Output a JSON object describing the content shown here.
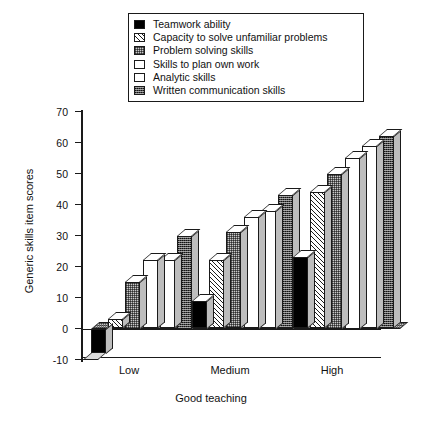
{
  "chart_data": {
    "type": "bar",
    "title": "",
    "subtitle": "",
    "xlabel": "Good teaching",
    "ylabel": "Generic skills item scores",
    "categories": [
      "Low",
      "Medium",
      "High"
    ],
    "ylim": [
      -10,
      70
    ],
    "yticks": [
      -10,
      0,
      10,
      20,
      30,
      40,
      50,
      60,
      70
    ],
    "grid": false,
    "legend_position": "top-center",
    "style": "3d-clustered-column",
    "series": [
      {
        "name": "Teamwork ability",
        "pattern": "solid-black",
        "values": [
          -8,
          9,
          23
        ]
      },
      {
        "name": "Capacity to solve unfamiliar problems",
        "pattern": "diagonal-hatch",
        "values": [
          3,
          22,
          44
        ]
      },
      {
        "name": "Problem solving skills",
        "pattern": "grey-stipple",
        "values": [
          15,
          31,
          50
        ]
      },
      {
        "name": "Skills to plan own work",
        "pattern": "white",
        "values": [
          22,
          36,
          55
        ]
      },
      {
        "name": "Analytic skills",
        "pattern": "white",
        "values": [
          22,
          38,
          59
        ]
      },
      {
        "name": "Written communication skills",
        "pattern": "dark-stipple",
        "values": [
          30,
          43,
          62
        ]
      }
    ]
  },
  "legend": {
    "items": [
      {
        "label": "Teamwork ability",
        "swatch": "solid-black"
      },
      {
        "label": "Capacity to solve unfamiliar problems",
        "swatch": "diagonal-hatch"
      },
      {
        "label": "Problem solving skills",
        "swatch": "grey-stipple"
      },
      {
        "label": "Skills to plan own work",
        "swatch": "white"
      },
      {
        "label": "Analytic skills",
        "swatch": "white"
      },
      {
        "label": "Written communication skills",
        "swatch": "dark-stipple"
      }
    ]
  },
  "axis": {
    "y_title": "Generic skills item scores",
    "x_title": "Good teaching",
    "y_tick_labels": [
      "70",
      "60",
      "50",
      "40",
      "30",
      "20",
      "10",
      "0",
      "-10"
    ],
    "x_tick_labels": [
      "Low",
      "Medium",
      "High"
    ]
  },
  "colors": {
    "ink": "#1a1a1a",
    "background": "#ffffff",
    "bar_side": "#bdbdbd",
    "bar_top": "#ffffff",
    "stipple_grey": "#c9c9c9",
    "stipple_dark": "#4a4a4a"
  }
}
